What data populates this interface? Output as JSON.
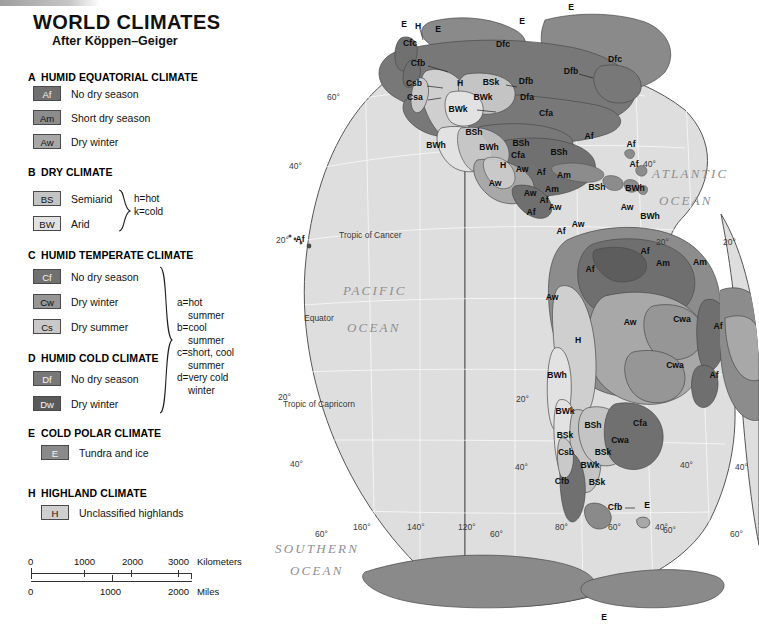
{
  "header": {
    "title": "WORLD CLIMATES",
    "subtitle": "After Köppen–Geiger"
  },
  "legend": {
    "groups": [
      {
        "letter": "A",
        "title": "HUMID EQUATORIAL CLIMATE",
        "items": [
          {
            "code": "Af",
            "label": "No dry season",
            "swatch": "#6f6f6f",
            "text_light": true
          },
          {
            "code": "Am",
            "label": "Short dry season",
            "swatch": "#8c8c8c",
            "text_light": false
          },
          {
            "code": "Aw",
            "label": "Dry winter",
            "swatch": "#a8a8a8",
            "text_light": false
          }
        ]
      },
      {
        "letter": "B",
        "title": "DRY CLIMATE",
        "items": [
          {
            "code": "BS",
            "label": "Semiarid",
            "swatch": "#c4c4c4",
            "text_light": false
          },
          {
            "code": "BW",
            "label": "Arid",
            "swatch": "#e2e2e2",
            "text_light": false
          }
        ],
        "note": "h=hot\nk=cold"
      },
      {
        "letter": "C",
        "title": "HUMID TEMPERATE CLIMATE",
        "items": [
          {
            "code": "Cf",
            "label": "No dry season",
            "swatch": "#707070",
            "text_light": true
          },
          {
            "code": "Cw",
            "label": "Dry winter",
            "swatch": "#969696",
            "text_light": false
          },
          {
            "code": "Cs",
            "label": "Dry summer",
            "swatch": "#c9c9c9",
            "text_light": false
          }
        ]
      },
      {
        "letter": "D",
        "title": "HUMID COLD CLIMATE",
        "items": [
          {
            "code": "Df",
            "label": "No dry season",
            "swatch": "#787878",
            "text_light": true
          },
          {
            "code": "Dw",
            "label": "Dry winter",
            "swatch": "#5a5a5a",
            "text_light": true
          }
        ],
        "note": "a=hot\n    summer\nb=cool\n    summer\nc=short, cool\n    summer\nd=very cold\n    winter"
      },
      {
        "letter": "E",
        "title": "COLD POLAR CLIMATE",
        "items": [
          {
            "code": "E",
            "label": "Tundra and ice",
            "swatch": "#8a8a8a",
            "text_light": true
          }
        ]
      },
      {
        "letter": "H",
        "title": "HIGHLAND CLIMATE",
        "items": [
          {
            "code": "H",
            "label": "Unclassified highlands",
            "swatch": "#cfcfcf",
            "text_light": false
          }
        ]
      }
    ]
  },
  "scale": {
    "km": {
      "ticks": [
        "0",
        "1000",
        "2000",
        "3000"
      ],
      "unit": "Kilometers"
    },
    "mi": {
      "ticks": [
        "0",
        "1000",
        "2000"
      ],
      "unit": "Miles"
    }
  },
  "map": {
    "ocean_labels": [
      {
        "line1": "PACIFIC",
        "line2": "OCEAN"
      },
      {
        "line1": "ATLANTIC",
        "line2": "OCEAN"
      },
      {
        "line1": "SOUTHERN",
        "line2": "OCEAN"
      }
    ],
    "reference_lines": [
      "Tropic of Cancer",
      "Equator",
      "Tropic of Capricorn"
    ],
    "latitude_labels": [
      "60°",
      "40°",
      "20°",
      "20°",
      "40°",
      "60°"
    ],
    "longitude_labels": [
      "160°",
      "140°",
      "120°",
      "80°",
      "60°",
      "40°"
    ],
    "climate_codes": [
      "Af",
      "Am",
      "Aw",
      "BSh",
      "BSk",
      "BWh",
      "BWk",
      "Cfa",
      "Cfb",
      "Cfc",
      "Csa",
      "Csb",
      "Cwa",
      "Dfa",
      "Dfb",
      "Dfc",
      "E",
      "H"
    ]
  },
  "chart_data": {
    "type": "map",
    "title": "WORLD CLIMATES",
    "subtitle": "After Köppen–Geiger",
    "projection": "interrupted Goode homolosine (Americas lobe)",
    "map_point_labels": [
      {
        "code": "E",
        "x": 189,
        "y": 27
      },
      {
        "code": "E",
        "x": 223,
        "y": 32
      },
      {
        "code": "E",
        "x": 307,
        "y": 24
      },
      {
        "code": "E",
        "x": 356,
        "y": 10
      },
      {
        "code": "H",
        "x": 203,
        "y": 29
      },
      {
        "code": "Cfc",
        "x": 195,
        "y": 46
      },
      {
        "code": "Cfb",
        "x": 203,
        "y": 66
      },
      {
        "code": "Dfc",
        "x": 288,
        "y": 47
      },
      {
        "code": "Dfc",
        "x": 400,
        "y": 62
      },
      {
        "code": "Csb",
        "x": 199,
        "y": 86
      },
      {
        "code": "Csa",
        "x": 200,
        "y": 100
      },
      {
        "code": "H",
        "x": 245,
        "y": 86
      },
      {
        "code": "BSk",
        "x": 276,
        "y": 85
      },
      {
        "code": "Dfb",
        "x": 311,
        "y": 84
      },
      {
        "code": "Dfb",
        "x": 356,
        "y": 74
      },
      {
        "code": "BWk",
        "x": 268,
        "y": 100
      },
      {
        "code": "Dfa",
        "x": 312,
        "y": 100
      },
      {
        "code": "BWk",
        "x": 243,
        "y": 112
      },
      {
        "code": "Cfa",
        "x": 331,
        "y": 116
      },
      {
        "code": "BSh",
        "x": 259,
        "y": 135
      },
      {
        "code": "BWh",
        "x": 221,
        "y": 148
      },
      {
        "code": "BWh",
        "x": 274,
        "y": 150
      },
      {
        "code": "BSh",
        "x": 306,
        "y": 146
      },
      {
        "code": "Cfa",
        "x": 303,
        "y": 158
      },
      {
        "code": "BSh",
        "x": 344,
        "y": 155
      },
      {
        "code": "H",
        "x": 288,
        "y": 168
      },
      {
        "code": "Aw",
        "x": 307,
        "y": 172
      },
      {
        "code": "Aw",
        "x": 280,
        "y": 186
      },
      {
        "code": "Af",
        "x": 326,
        "y": 175
      },
      {
        "code": "Am",
        "x": 349,
        "y": 178
      },
      {
        "code": "Aw",
        "x": 315,
        "y": 196
      },
      {
        "code": "Am",
        "x": 337,
        "y": 192
      },
      {
        "code": "Af",
        "x": 329,
        "y": 203
      },
      {
        "code": "Af",
        "x": 316,
        "y": 215
      },
      {
        "code": "Aw",
        "x": 340,
        "y": 210
      },
      {
        "code": "BSh",
        "x": 382,
        "y": 190
      },
      {
        "code": "BWh",
        "x": 420,
        "y": 191
      },
      {
        "code": "Af",
        "x": 419,
        "y": 167
      },
      {
        "code": "Af",
        "x": 416,
        "y": 147
      },
      {
        "code": "Af",
        "x": 374,
        "y": 139
      },
      {
        "code": "Aw",
        "x": 363,
        "y": 227
      },
      {
        "code": "Aw",
        "x": 412,
        "y": 210
      },
      {
        "code": "Af",
        "x": 346,
        "y": 234
      },
      {
        "code": "BWh",
        "x": 435,
        "y": 219
      },
      {
        "code": "Am",
        "x": 448,
        "y": 266
      },
      {
        "code": "Af",
        "x": 430,
        "y": 254
      },
      {
        "code": "Am",
        "x": 485,
        "y": 265
      },
      {
        "code": "Af",
        "x": 375,
        "y": 272
      },
      {
        "code": "Aw",
        "x": 337,
        "y": 300
      },
      {
        "code": "Aw",
        "x": 415,
        "y": 325
      },
      {
        "code": "Cwa",
        "x": 467,
        "y": 322
      },
      {
        "code": "Af",
        "x": 503,
        "y": 329
      },
      {
        "code": "H",
        "x": 363,
        "y": 343
      },
      {
        "code": "Cwa",
        "x": 460,
        "y": 368
      },
      {
        "code": "Af",
        "x": 499,
        "y": 378
      },
      {
        "code": "BWh",
        "x": 342,
        "y": 378
      },
      {
        "code": "BWk",
        "x": 350,
        "y": 414
      },
      {
        "code": "BSh",
        "x": 378,
        "y": 428
      },
      {
        "code": "Cfa",
        "x": 425,
        "y": 426
      },
      {
        "code": "BSk",
        "x": 350,
        "y": 438
      },
      {
        "code": "Cwa",
        "x": 405,
        "y": 443
      },
      {
        "code": "Csb",
        "x": 351,
        "y": 455
      },
      {
        "code": "BSk",
        "x": 388,
        "y": 455
      },
      {
        "code": "BWk",
        "x": 375,
        "y": 468
      },
      {
        "code": "Cfb",
        "x": 347,
        "y": 484
      },
      {
        "code": "BSk",
        "x": 382,
        "y": 485
      },
      {
        "code": "Cfb",
        "x": 400,
        "y": 510
      },
      {
        "code": "E",
        "x": 432,
        "y": 508
      },
      {
        "code": "Af",
        "x": 85,
        "y": 242
      },
      {
        "code": "E",
        "x": 389,
        "y": 620
      }
    ]
  }
}
